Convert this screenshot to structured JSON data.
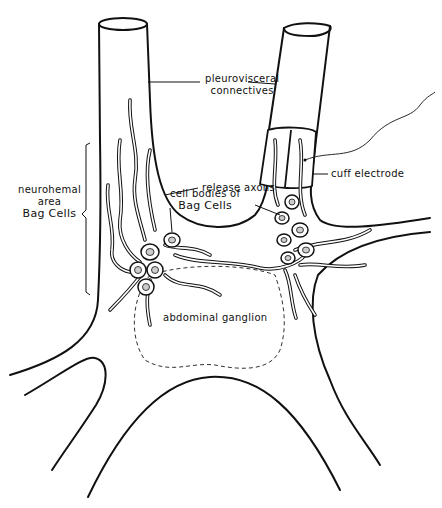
{
  "diagram": {
    "type": "anatomical line drawing",
    "colors": {
      "line": "#111111",
      "background": "#ffffff"
    },
    "labels": {
      "pleurovisceral_1": "pleurovisceral",
      "pleurovisceral_2": "connectives",
      "release_axons": "release axons",
      "cell_bodies_1": "cell bodies of",
      "cell_bodies_2": "Bag Cells",
      "cuff_electrode": "cuff electrode",
      "neurohemal_1": "neurohemal",
      "neurohemal_2": "area",
      "neurohemal_3": "Bag Cells",
      "abdominal_ganglion": "abdominal ganglion"
    }
  }
}
